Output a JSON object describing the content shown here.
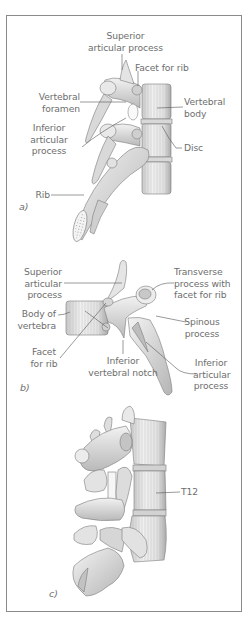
{
  "figure": {
    "panels": [
      {
        "id": "a",
        "panel_label": "a)",
        "labels": {
          "superior_articular_process": [
            "Superior",
            "articular process"
          ],
          "facet_for_rib": [
            "Facet for rib"
          ],
          "vertebral_foramen": [
            "Vertebral",
            "foramen"
          ],
          "vertebral_body": [
            "Vertebral",
            "body"
          ],
          "inferior_articular_process": [
            "Inferior",
            "articular",
            "process"
          ],
          "disc": [
            "Disc"
          ],
          "rib": [
            "Rib"
          ]
        }
      },
      {
        "id": "b",
        "panel_label": "b)",
        "labels": {
          "superior_articular_process": [
            "Superior",
            "articular",
            "process"
          ],
          "transverse_process": [
            "Transverse",
            "process with",
            "facet for rib"
          ],
          "body_of_vertebra": [
            "Body of",
            "vertebra"
          ],
          "spinous_process": [
            "Spinous",
            "process"
          ],
          "facet_for_rib": [
            "Facet",
            "for rib"
          ],
          "inferior_vertebral_notch": [
            "Inferior",
            "vertebral notch"
          ],
          "inferior_articular_process": [
            "Inferior",
            "articular",
            "process"
          ]
        }
      },
      {
        "id": "c",
        "panel_label": "c)",
        "labels": {
          "t12": [
            "T12"
          ]
        }
      }
    ],
    "colors": {
      "frame": "#8a8a8a",
      "label_text": "#6e6e6e",
      "leader_line": "#555555",
      "bone_fill": "#e6e6e6",
      "bone_shade": "#bdbdbd",
      "bone_outline": "#7a7a7a"
    }
  }
}
